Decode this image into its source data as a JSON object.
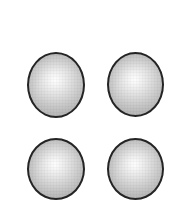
{
  "figure": {
    "background_color": "#ffffff",
    "width": 176,
    "height": 207,
    "object_count": 4,
    "object_name": "sphere",
    "layout": "2x2 grid"
  },
  "style": {
    "outline_color": "#242424",
    "outline_width_px": 2.5,
    "highlight_color": "#fdfdfd",
    "midtone_color": "#d5d5d5",
    "shadow_color": "#a3a3a3",
    "highlight_position": "48% 42%"
  },
  "spheres": [
    {
      "id": "sphere-top-left",
      "label": "Top left sphere",
      "row": 1,
      "column": 1,
      "left": 27,
      "top": 52,
      "width": 58,
      "height": 66
    },
    {
      "id": "sphere-top-right",
      "label": "Top right sphere",
      "row": 1,
      "column": 2,
      "left": 107,
      "top": 52,
      "width": 57,
      "height": 65
    },
    {
      "id": "sphere-bottom-left",
      "label": "Bottom left sphere",
      "row": 2,
      "column": 1,
      "left": 27,
      "top": 138,
      "width": 58,
      "height": 62
    },
    {
      "id": "sphere-bottom-right",
      "label": "Bottom right sphere",
      "row": 2,
      "column": 2,
      "left": 107,
      "top": 138,
      "width": 57,
      "height": 62
    }
  ]
}
